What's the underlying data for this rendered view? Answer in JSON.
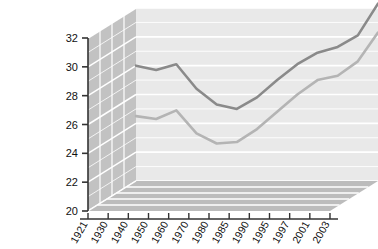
{
  "chart_data": {
    "type": "line",
    "title": "",
    "xlabel": "",
    "ylabel": "",
    "categories": [
      "1921",
      "1930",
      "1940",
      "1950",
      "1960",
      "1970",
      "1980",
      "1985",
      "1990",
      "1995",
      "1997",
      "2001",
      "2003"
    ],
    "series": [
      {
        "name": "Males",
        "color": "#8a8a8a",
        "values": [
          28.0,
          27.7,
          28.1,
          26.4,
          25.3,
          25.0,
          25.8,
          27.0,
          28.1,
          28.9,
          29.3,
          30.1,
          32.3
        ]
      },
      {
        "name": "Females",
        "color": "#b4b4b4",
        "values": [
          24.5,
          24.3,
          24.9,
          23.3,
          22.6,
          22.7,
          23.6,
          24.8,
          26.0,
          27.0,
          27.3,
          28.3,
          30.3
        ]
      }
    ],
    "ylim": [
      20,
      32
    ],
    "yticks": [
      20,
      22,
      24,
      26,
      28,
      30,
      32
    ],
    "ytick_labels": [
      "20",
      "22",
      "24",
      "26",
      "28",
      "30",
      "32"
    ],
    "grid": true,
    "legend_position": "right-inline",
    "style": "3d-area-walls"
  },
  "legend": {
    "males_label": "Males",
    "females_label": "Females"
  },
  "colors": {
    "plot_background": "#e9e9e9",
    "left_wall": "#c2c2c2",
    "floor": "#bcbcbc",
    "gridline": "#ffffff",
    "axis": "#333333",
    "males_line": "#8a8a8a",
    "females_line": "#b4b4b4",
    "page_background": "#ffffff"
  }
}
